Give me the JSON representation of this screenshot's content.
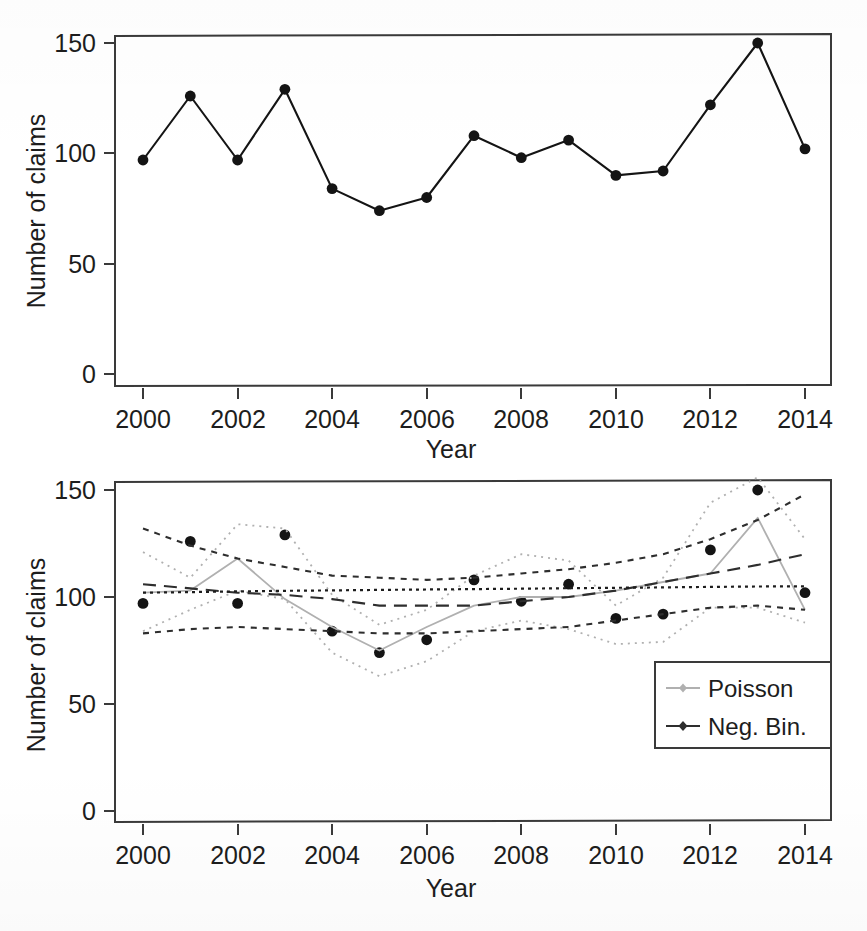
{
  "figure": {
    "panels": [
      "top",
      "bottom"
    ],
    "caption_fragment": ""
  },
  "colors": {
    "observed": "#141414",
    "neg_bin": "#2e2e2e",
    "poisson": "#b0b0b0",
    "axis": "#3a3a3a",
    "background": "#ffffff"
  },
  "top_panel": {
    "ylabel": "Number of claims",
    "xlabel": "Year",
    "y_ticks": [
      "0",
      "50",
      "100",
      "150"
    ],
    "x_ticks": [
      "2000",
      "2002",
      "2004",
      "2006",
      "2008",
      "2010",
      "2012",
      "2014"
    ]
  },
  "bottom_panel": {
    "ylabel": "Number of claims",
    "xlabel": "Year",
    "y_ticks": [
      "0",
      "50",
      "100",
      "150"
    ],
    "x_ticks": [
      "2000",
      "2002",
      "2004",
      "2006",
      "2008",
      "2010",
      "2012",
      "2014"
    ],
    "legend": {
      "position": "bottom-right",
      "items": [
        {
          "label": "Poisson",
          "color": "#b0b0b0",
          "marker": "diamond",
          "line": "solid-thin"
        },
        {
          "label": "Neg. Bin.",
          "color": "#2e2e2e",
          "marker": "diamond",
          "line": "solid-thin"
        }
      ]
    }
  },
  "chart_data": [
    {
      "type": "line",
      "panel": "top",
      "title": "",
      "xlabel": "Year",
      "ylabel": "Number of claims",
      "xlim": [
        1999.4,
        2014.6
      ],
      "ylim": [
        0,
        158
      ],
      "y_ticks": [
        0,
        50,
        100,
        150
      ],
      "x_ticks": [
        2000,
        2002,
        2004,
        2006,
        2008,
        2010,
        2012,
        2014
      ],
      "grid": false,
      "legend": "none",
      "x": [
        2000,
        2001,
        2002,
        2003,
        2004,
        2005,
        2006,
        2007,
        2008,
        2009,
        2010,
        2011,
        2012,
        2013,
        2014
      ],
      "series": [
        {
          "name": "Observed number of claims",
          "marker": "filled-circle",
          "color": "#141414",
          "values": [
            97,
            126,
            97,
            129,
            84,
            74,
            80,
            108,
            98,
            106,
            90,
            92,
            122,
            150,
            102
          ]
        }
      ]
    },
    {
      "type": "line",
      "panel": "bottom",
      "title": "",
      "xlabel": "Year",
      "ylabel": "Number of claims",
      "xlim": [
        1999.4,
        2014.6
      ],
      "ylim": [
        0,
        158
      ],
      "y_ticks": [
        0,
        50,
        100,
        150
      ],
      "x_ticks": [
        2000,
        2002,
        2004,
        2006,
        2008,
        2010,
        2012,
        2014
      ],
      "grid": false,
      "legend": "Poisson / Neg. Bin.",
      "x": [
        2000,
        2001,
        2002,
        2003,
        2004,
        2005,
        2006,
        2007,
        2008,
        2009,
        2010,
        2011,
        2012,
        2013,
        2014
      ],
      "series": [
        {
          "name": "Observed",
          "marker": "filled-circle",
          "color": "#141414",
          "style": "points",
          "values": [
            97,
            126,
            97,
            129,
            84,
            74,
            80,
            108,
            98,
            106,
            90,
            92,
            122,
            150,
            102
          ]
        },
        {
          "name": "Poisson fitted",
          "marker": "diamond",
          "color": "#b0b0b0",
          "style": "solid-thin",
          "values": [
            102,
            103,
            118,
            99,
            86,
            75,
            86,
            96,
            100,
            100,
            103,
            107,
            111,
            137,
            94
          ]
        },
        {
          "name": "Poisson upper bound",
          "marker": "diamond",
          "color": "#b0b0b0",
          "style": "dotted",
          "values": [
            121,
            109,
            134,
            132,
            101,
            87,
            94,
            110,
            120,
            117,
            96,
            109,
            144,
            156,
            127
          ]
        },
        {
          "name": "Poisson lower bound",
          "marker": "diamond",
          "color": "#b0b0b0",
          "style": "dotted",
          "values": [
            84,
            94,
            103,
            99,
            74,
            63,
            70,
            84,
            89,
            85,
            78,
            79,
            95,
            95,
            88
          ]
        },
        {
          "name": "Neg. Bin. fitted",
          "marker": "diamond",
          "color": "#2e2e2e",
          "style": "long-dash",
          "values": [
            106,
            104,
            102,
            101,
            99,
            96,
            96,
            96,
            98,
            100,
            103,
            107,
            111,
            115,
            120
          ]
        },
        {
          "name": "Neg. Bin. upper bound",
          "marker": "diamond",
          "color": "#2e2e2e",
          "style": "dashed",
          "values": [
            132,
            124,
            118,
            114,
            110,
            109,
            108,
            109,
            111,
            113,
            116,
            120,
            127,
            136,
            148
          ]
        },
        {
          "name": "Neg. Bin. lower bound",
          "marker": "diamond",
          "color": "#2e2e2e",
          "style": "dashed",
          "values": [
            83,
            85,
            86,
            85,
            84,
            83,
            83,
            84,
            85,
            86,
            89,
            92,
            95,
            96,
            94
          ]
        },
        {
          "name": "Reference level",
          "marker": "none",
          "color": "#1d1d1d",
          "style": "fine-dotted",
          "values": [
            102,
            102.3,
            102.6,
            102.9,
            103.1,
            103.3,
            103.5,
            103.7,
            103.9,
            104.1,
            104.3,
            104.5,
            104.7,
            104.9,
            105
          ]
        }
      ]
    }
  ]
}
